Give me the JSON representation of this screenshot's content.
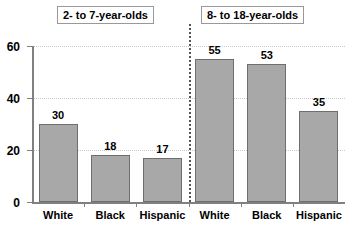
{
  "chart_data": {
    "type": "bar",
    "title": "",
    "xlabel": "",
    "ylabel": "",
    "ylim": [
      0,
      60
    ],
    "yticks": [
      0,
      20,
      40,
      60
    ],
    "grid": true,
    "legend": false,
    "categories": [
      "White",
      "Black",
      "Hispanic"
    ],
    "panels": [
      {
        "label": "2- to 7-year-olds",
        "categories": [
          "White",
          "Black",
          "Hispanic"
        ],
        "values": [
          30,
          18,
          17
        ]
      },
      {
        "label": "8- to 18-year-olds",
        "categories": [
          "White",
          "Black",
          "Hispanic"
        ],
        "values": [
          55,
          53,
          35
        ]
      }
    ],
    "colors": {
      "bar_fill": "#a8a8a8",
      "bar_border": "#6e6e6e",
      "gridline": "#c9c9c9",
      "axis": "#808080",
      "divider": "#555555",
      "text": "#000000"
    }
  },
  "axis": {
    "tick_labels": [
      "0",
      "20",
      "40",
      "60"
    ]
  },
  "headers": [
    {
      "label": "2- to 7-year-olds"
    },
    {
      "label": "8- to 18-year-olds"
    }
  ]
}
